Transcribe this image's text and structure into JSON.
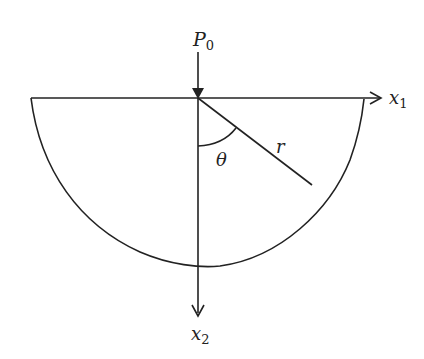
{
  "diagram": {
    "labels": {
      "force": "P",
      "force_sub": "0",
      "axis1": "x",
      "axis1_sub": "1",
      "axis2": "x",
      "axis2_sub": "2",
      "radius": "r",
      "angle": "θ"
    },
    "colors": {
      "stroke": "#222222",
      "background": "#ffffff"
    }
  }
}
